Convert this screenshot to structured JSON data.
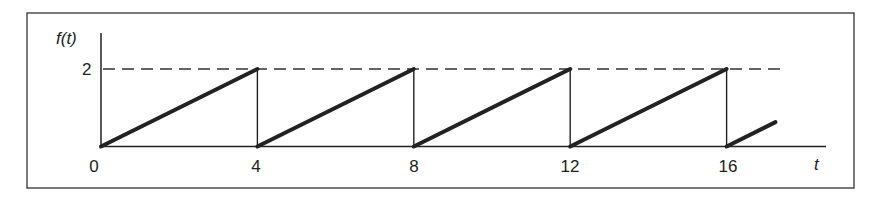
{
  "chart_data": {
    "type": "line",
    "title": "",
    "xlabel": "t",
    "ylabel": "f(t)",
    "x_ticks": [
      "0",
      "4",
      "8",
      "12",
      "16"
    ],
    "y_ticks": [
      "2"
    ],
    "xlim": [
      0,
      18.6
    ],
    "ylim": [
      0,
      2.9
    ],
    "period": 4,
    "amplitude": 2,
    "series": [
      {
        "name": "f(t)",
        "segments": [
          {
            "x": [
              0,
              4
            ],
            "y": [
              0,
              2
            ]
          },
          {
            "x": [
              4,
              8
            ],
            "y": [
              0,
              2
            ]
          },
          {
            "x": [
              8,
              12
            ],
            "y": [
              0,
              2
            ]
          },
          {
            "x": [
              12,
              16
            ],
            "y": [
              0,
              2
            ]
          },
          {
            "x": [
              16,
              17.25
            ],
            "y": [
              0,
              0.63
            ]
          }
        ]
      }
    ],
    "vertical_drops_at": [
      4,
      8,
      12,
      16
    ],
    "reference_line": {
      "y": 2,
      "style": "dashed",
      "x_end": 17.4
    },
    "grid": false,
    "legend": "none"
  },
  "labels": {
    "ylabel": "f(t)",
    "xlabel": "t",
    "ytick": "2",
    "xticks": [
      "0",
      "4",
      "8",
      "12",
      "16"
    ]
  }
}
